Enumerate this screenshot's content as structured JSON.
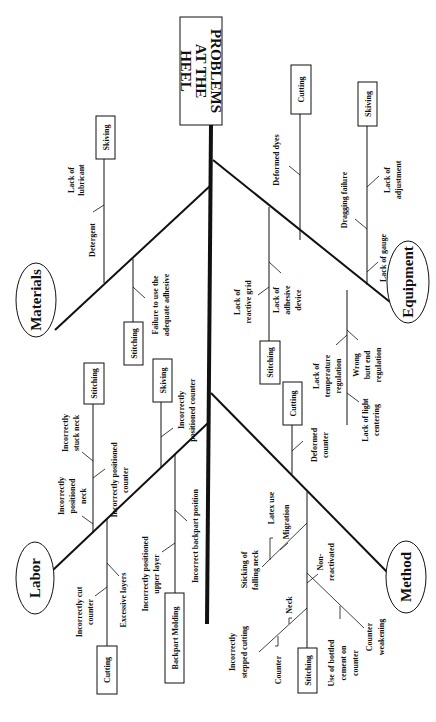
{
  "diagram": {
    "type": "fishbone",
    "head": {
      "lines": [
        "PROBLEMS",
        "AT THE",
        "HEEL"
      ]
    },
    "categories": {
      "materials": {
        "label": "Materials",
        "sub": {
          "skiving": {
            "label": "Skiving",
            "causes": [
              "Lack of",
              "lubricant",
              "Detergent"
            ]
          },
          "stitching": {
            "label": "Stitching",
            "causes": [
              "Failure to use the",
              "adequate adhesive"
            ]
          }
        }
      },
      "labor": {
        "label": "Labor",
        "sub": {
          "stitching": {
            "label": "Stitching",
            "causes": [
              "Incorrectly",
              "stuck neck",
              "Incorrectly",
              "positioned",
              "neck",
              "Incorrectly positioned",
              "counter"
            ]
          },
          "skiving": {
            "label": "Skiving",
            "causes": [
              "Incorrectly",
              "positioned counter"
            ]
          },
          "cutting": {
            "label": "Cutting",
            "causes": [
              "Incorrectly cut",
              "counter",
              "Excessive layers"
            ]
          },
          "backpart": {
            "label": "Backpart Molding",
            "causes": [
              "Incorrectly positioned",
              "upper layer",
              "Incorrect backpart position"
            ]
          }
        }
      },
      "equipment": {
        "label": "Equipment",
        "sub": {
          "cutting": {
            "label": "Cutting",
            "causes": [
              "Deformed dyes"
            ]
          },
          "skiving": {
            "label": "Skiving",
            "causes": [
              "Lack of",
              "adjustment",
              "Dragging failure",
              "Lack of gauge"
            ]
          },
          "stitching": {
            "label": "Stitching",
            "causes": [
              "Lack of",
              "reactive grid",
              "Lack of",
              "adhesive",
              "device"
            ]
          },
          "other": {
            "causes": [
              "Lack of",
              "temperature",
              "regulation",
              "Wrong",
              "butt end",
              "regulation",
              "Lack of light",
              "centering"
            ]
          }
        }
      },
      "method": {
        "label": "Method",
        "sub": {
          "cutting": {
            "label": "Cutting",
            "causes": [
              "Deformed",
              "counter"
            ]
          },
          "stitching": {
            "label": "Stitching",
            "causes": [
              "Latex use",
              "Migration",
              "Sticking of",
              "falling neck",
              "Non-",
              "reactivated",
              "Neck",
              "Incorrectly",
              "stepped cutting",
              "Counter",
              "Use of bottled",
              "cement on",
              "counter",
              "Counter",
              "weakening"
            ]
          }
        }
      }
    }
  }
}
